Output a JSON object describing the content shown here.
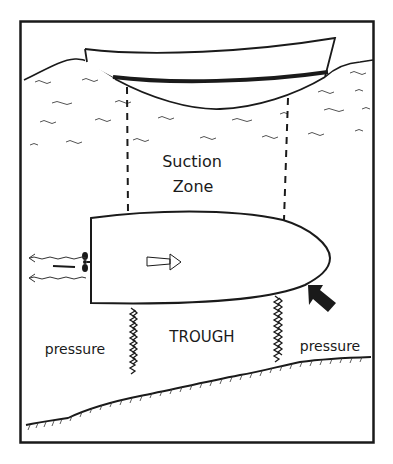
{
  "diagram": {
    "labels": {
      "suction_line1": "Suction",
      "suction_line2": "Zone",
      "trough": "TROUGH",
      "pressure_left": "pressure",
      "pressure_right": "pressure"
    },
    "colors": {
      "ink": "#1a1a1a",
      "background": "#ffffff",
      "water_ripple": "#555555"
    },
    "elements": [
      "passing boat hull (side view)",
      "waves / water surface",
      "dashed suction-zone lines",
      "own boat hull (top view)",
      "propeller with wash arrows",
      "direction-of-travel arrow",
      "bow push arrow",
      "trough turbulence columns",
      "sloped river bed"
    ]
  }
}
